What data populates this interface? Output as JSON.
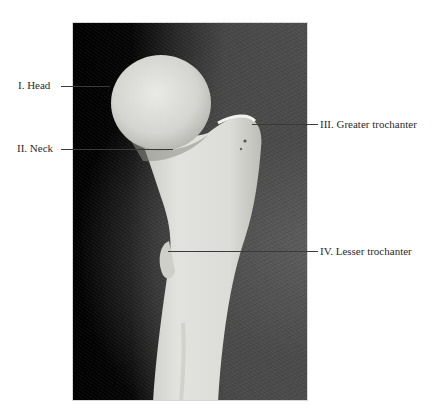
{
  "figure": {
    "labels": [
      {
        "id": "head",
        "text": "I. Head"
      },
      {
        "id": "neck",
        "text": "II. Neck"
      },
      {
        "id": "greater-trochanter",
        "text": "III. Greater trochanter"
      },
      {
        "id": "lesser-trochanter",
        "text": "IV. Lesser trochanter"
      }
    ],
    "colors": {
      "background": "#ffffff",
      "photo_backdrop_left": "#000000",
      "photo_backdrop_right": "#4e4e4e",
      "bone": "#d9d9d6",
      "label_text": "#2a2a2a",
      "leader_line": "#3a3a3a"
    }
  }
}
